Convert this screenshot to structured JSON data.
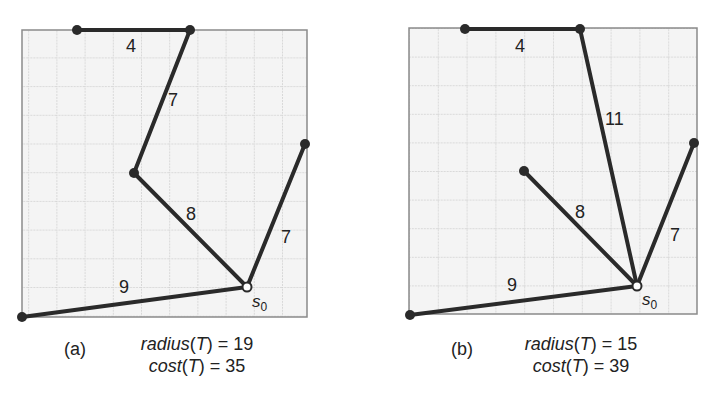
{
  "panels": [
    {
      "id": "a",
      "label": "(a)",
      "radius_text": "radius",
      "cost_text": "cost",
      "T": "T",
      "radius_value": "= 19",
      "cost_value": "= 35",
      "root_label": "s",
      "root_sub": "0",
      "edge_labels": [
        "4",
        "7",
        "8",
        "7",
        "9"
      ]
    },
    {
      "id": "b",
      "label": "(b)",
      "radius_text": "radius",
      "cost_text": "cost",
      "T": "T",
      "radius_value": "= 15",
      "cost_value": "= 39",
      "root_label": "s",
      "root_sub": "0",
      "edge_labels": [
        "4",
        "11",
        "8",
        "7",
        "9"
      ]
    }
  ],
  "colors": {
    "edge": "#2a2a2a",
    "grid": "#bdbdbd",
    "grid_bg": "#f4f4f4",
    "border": "#8a8a8a"
  }
}
